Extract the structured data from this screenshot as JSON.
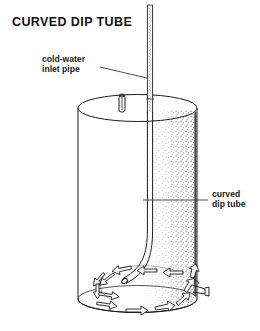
{
  "figure": {
    "title": "CURVED DIP TUBE",
    "type": "technical-line-diagram"
  },
  "labels": [
    {
      "id": "cold-water-inlet",
      "line1": "cold-water",
      "line2": "inlet pipe",
      "text_x": 42,
      "text_y": 62,
      "leader_from_x": 100,
      "leader_from_y": 67,
      "leader_to_x": 147,
      "leader_to_y": 78
    },
    {
      "id": "curved-dip-tube",
      "line1": "curved",
      "line2": "dip tube",
      "text_x": 212,
      "text_y": 197,
      "leader_from_x": 208,
      "leader_from_y": 200,
      "leader_to_x": 143,
      "leader_to_y": 200
    }
  ],
  "colors": {
    "ink": "#1d1d1d",
    "ink_thin": "#2a2a2a",
    "leader": "#3a3a3a",
    "paper": "#ffffff",
    "stipple": "#4a4a4a"
  },
  "geometry": {
    "tank": {
      "left_x": 78,
      "right_x": 197,
      "top_center_y": 108,
      "bottom_center_y": 299,
      "ellipse_rx": 59.5,
      "ellipse_ry": 13.5
    },
    "inlet_pipe": {
      "x_left": 147,
      "x_right": 153,
      "y_top": 5,
      "y_bottom": 112
    },
    "top_port": {
      "x": 119,
      "y": 95,
      "width": 6,
      "height": 17
    },
    "outlet_nozzle": {
      "x": 196,
      "y": 288
    }
  },
  "flow_arrows": {
    "description": "swirling circulation arrows around tank floor",
    "count": 13
  }
}
